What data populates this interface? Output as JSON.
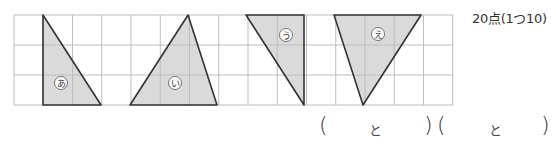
{
  "score_text": "20点(1つ10)",
  "grid": {
    "x0": 14,
    "y0": 15,
    "cell": 29.25,
    "cols": 15,
    "rows": 3,
    "line_color": "#bdbdbd"
  },
  "triangles": [
    {
      "label": "あ",
      "points": [
        [
          43,
          15
        ],
        [
          43,
          105
        ],
        [
          101,
          105
        ]
      ],
      "label_pos": [
        61,
        83
      ]
    },
    {
      "label": "い",
      "points": [
        [
          130,
          105
        ],
        [
          188,
          15
        ],
        [
          217,
          105
        ]
      ],
      "label_pos": [
        175,
        83
      ]
    },
    {
      "label": "う",
      "points": [
        [
          246,
          15
        ],
        [
          304,
          15
        ],
        [
          304,
          105
        ]
      ],
      "label_pos": [
        286,
        35
      ]
    },
    {
      "label": "え",
      "points": [
        [
          334,
          15
        ],
        [
          421,
          15
        ],
        [
          363,
          105
        ]
      ],
      "label_pos": [
        378,
        34
      ]
    }
  ],
  "fill_color": "#dadada",
  "stroke_color": "#333333",
  "answers": [
    {
      "open": "(",
      "middle": "と",
      "close": ")"
    },
    {
      "open": "(",
      "middle": "と",
      "close": ")"
    }
  ]
}
